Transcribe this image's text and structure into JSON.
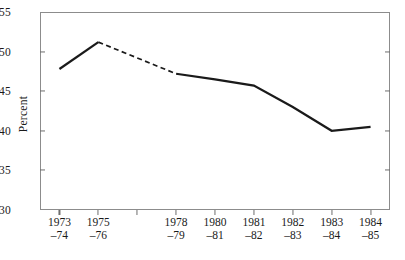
{
  "chart_data": {
    "type": "line",
    "title": "",
    "xlabel": "",
    "ylabel": "Percent",
    "ylim": [
      30,
      55
    ],
    "yticks": [
      30,
      35,
      40,
      45,
      50,
      55
    ],
    "ytick_labels": [
      "30",
      "35",
      "40",
      "45",
      "50",
      "55"
    ],
    "grid": false,
    "legend": "none",
    "categories": [
      "1973–74",
      "1975–76",
      "",
      "1978–79",
      "1980–81",
      "1981–82",
      "1982–83",
      "1983–84",
      "1984–85"
    ],
    "xtick_labels": [
      {
        "line1": "1973",
        "line2": "–74"
      },
      {
        "line1": "1975",
        "line2": "–76"
      },
      {
        "line1": "",
        "line2": ""
      },
      {
        "line1": "1978",
        "line2": "–79"
      },
      {
        "line1": "1980",
        "line2": "–81"
      },
      {
        "line1": "1981",
        "line2": "–82"
      },
      {
        "line1": "1982",
        "line2": "–83"
      },
      {
        "line1": "1983",
        "line2": "–84"
      },
      {
        "line1": "1984",
        "line2": "–85"
      }
    ],
    "series": [
      {
        "name": "Percent",
        "points": [
          {
            "x": "1973–74",
            "y": 47.8,
            "style": "solid"
          },
          {
            "x": "1975–76",
            "y": 51.2,
            "style": "solid"
          },
          {
            "x": "1978–79",
            "y": 47.2,
            "style": "dashed"
          },
          {
            "x": "1980–81",
            "y": 46.5,
            "style": "solid"
          },
          {
            "x": "1981–82",
            "y": 45.7,
            "style": "solid"
          },
          {
            "x": "1982–83",
            "y": 43.0,
            "style": "solid"
          },
          {
            "x": "1983–84",
            "y": 40.0,
            "style": "solid"
          },
          {
            "x": "1984–85",
            "y": 40.5,
            "style": "solid"
          }
        ]
      }
    ],
    "annotations": [
      "Dashed segment between 1975–76 and 1978–79 indicates interpolated / missing data"
    ],
    "colors": {
      "line": "#1a1a1a",
      "axis": "#8c8c8c",
      "text": "#1a1a1a",
      "background": "#ffffff"
    }
  }
}
